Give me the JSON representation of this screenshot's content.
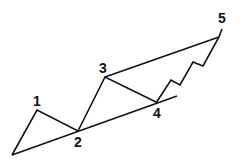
{
  "diagram": {
    "type": "elliott-wave-channel",
    "stroke_color": "#111111",
    "background": "#ffffff",
    "labels": [
      {
        "text": "1",
        "x": 37,
        "y": 106
      },
      {
        "text": "2",
        "x": 78,
        "y": 147
      },
      {
        "text": "3",
        "x": 103,
        "y": 73
      },
      {
        "text": "4",
        "x": 157,
        "y": 118
      },
      {
        "text": "5",
        "x": 222,
        "y": 23
      }
    ],
    "points": {
      "start": [
        12,
        155
      ],
      "p1": [
        37,
        110
      ],
      "p2": [
        78,
        131
      ],
      "p3": [
        105,
        77
      ],
      "p4": [
        156,
        102
      ],
      "p5": [
        219,
        37
      ]
    },
    "main_wave_path": "12,155 37,110 78,131 105,77 156,102",
    "fifth_wave_subwaves_path": "156,103 171,80 180,85 193,62 203,66 219,37 222,29",
    "lower_trendline": {
      "from": [
        12,
        155
      ],
      "to": [
        177,
        96
      ]
    },
    "upper_trendline": {
      "from": [
        105,
        77
      ],
      "to": [
        219,
        37
      ]
    }
  }
}
